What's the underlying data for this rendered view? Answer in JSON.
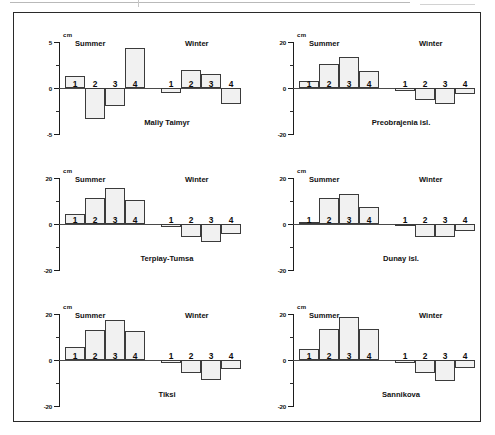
{
  "figure": {
    "unit": "cm",
    "season_summer": "Summer",
    "season_winter": "Winter"
  },
  "chart_data": [
    {
      "type": "bar",
      "title": "Maliy Taimyr",
      "ylabel": "cm",
      "ylim": [
        -5,
        5
      ],
      "yticks": [
        5,
        0,
        -5
      ],
      "ytick_labels": [
        "5",
        "0",
        "-5"
      ],
      "grid": false,
      "categories": [
        "1",
        "2",
        "3",
        "4"
      ],
      "groups": [
        "Summer",
        "Winter"
      ],
      "series": [
        {
          "name": "Summer",
          "values": [
            1.3,
            -3.4,
            -2.0,
            4.3
          ]
        },
        {
          "name": "Winter",
          "values": [
            -0.5,
            2.0,
            1.5,
            -1.7
          ]
        }
      ]
    },
    {
      "type": "bar",
      "title": "Preobrajenia isl.",
      "ylabel": "cm",
      "ylim": [
        -20,
        20
      ],
      "yticks": [
        20,
        0,
        -20
      ],
      "ytick_labels": [
        "20",
        "0",
        "-20"
      ],
      "grid": false,
      "categories": [
        "1",
        "2",
        "3",
        "4"
      ],
      "groups": [
        "Summer",
        "Winter"
      ],
      "series": [
        {
          "name": "Summer",
          "values": [
            3.0,
            10.5,
            13.5,
            7.5
          ]
        },
        {
          "name": "Winter",
          "values": [
            -1.3,
            -5.0,
            -7.0,
            -2.5
          ]
        }
      ]
    },
    {
      "type": "bar",
      "title": "Terpiay-Tumsa",
      "ylabel": "cm",
      "ylim": [
        -20,
        20
      ],
      "yticks": [
        20,
        0,
        -20
      ],
      "ytick_labels": [
        "20",
        "0",
        "-20"
      ],
      "grid": false,
      "categories": [
        "1",
        "2",
        "3",
        "4"
      ],
      "groups": [
        "Summer",
        "Winter"
      ],
      "series": [
        {
          "name": "Summer",
          "values": [
            4.5,
            11.5,
            15.5,
            10.5
          ]
        },
        {
          "name": "Winter",
          "values": [
            -1.5,
            -5.5,
            -8.0,
            -4.5
          ]
        }
      ]
    },
    {
      "type": "bar",
      "title": "Dunay isl.",
      "ylabel": "cm",
      "ylim": [
        -20,
        20
      ],
      "yticks": [
        20,
        0,
        -20
      ],
      "ytick_labels": [
        "20",
        "0",
        "-20"
      ],
      "grid": false,
      "categories": [
        "1",
        "2",
        "3",
        "4"
      ],
      "groups": [
        "Summer",
        "Winter"
      ],
      "series": [
        {
          "name": "Summer",
          "values": [
            0.6,
            11.5,
            13.0,
            7.5
          ]
        },
        {
          "name": "Winter",
          "values": [
            -0.8,
            -5.5,
            -5.5,
            -3.0
          ]
        }
      ]
    },
    {
      "type": "bar",
      "title": "Tiksi",
      "ylabel": "cm",
      "ylim": [
        -20,
        20
      ],
      "yticks": [
        20,
        0,
        -20
      ],
      "ytick_labels": [
        "20",
        "0",
        "-20"
      ],
      "grid": false,
      "categories": [
        "1",
        "2",
        "3",
        "4"
      ],
      "groups": [
        "Summer",
        "Winter"
      ],
      "series": [
        {
          "name": "Summer",
          "values": [
            5.5,
            13.0,
            17.5,
            12.5
          ]
        },
        {
          "name": "Winter",
          "values": [
            -1.5,
            -5.5,
            -8.5,
            -4.0
          ]
        }
      ]
    },
    {
      "type": "bar",
      "title": "Sannikova",
      "ylabel": "cm",
      "ylim": [
        -20,
        20
      ],
      "yticks": [
        20,
        0,
        -20
      ],
      "ytick_labels": [
        "20",
        "0",
        "-20"
      ],
      "grid": false,
      "categories": [
        "1",
        "2",
        "3",
        "4"
      ],
      "groups": [
        "Summer",
        "Winter"
      ],
      "series": [
        {
          "name": "Summer",
          "values": [
            5.0,
            13.5,
            18.5,
            13.5
          ]
        },
        {
          "name": "Winter",
          "values": [
            -1.5,
            -5.5,
            -9.0,
            -3.5
          ]
        }
      ]
    }
  ]
}
